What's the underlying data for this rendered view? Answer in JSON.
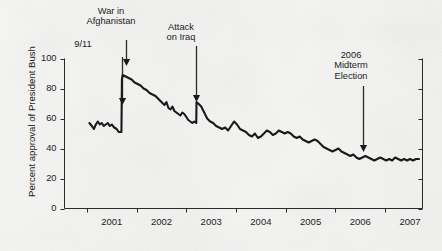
{
  "chart_data": {
    "type": "line",
    "title": "",
    "subtitle": "",
    "xlabel": "",
    "ylabel": "Percent approval of President Bush",
    "xlim": [
      2000.55,
      2007.75
    ],
    "ylim": [
      0,
      100
    ],
    "grid": false,
    "legend_position": "none",
    "series_name": "Presidential approval rating",
    "line_color": "#1a1a1a",
    "ytick_labels": [
      "0",
      "20",
      "40",
      "60",
      "80",
      "100"
    ],
    "ytick_values": [
      0,
      20,
      40,
      60,
      80,
      100
    ],
    "xtick_labels": [
      "2001",
      "2002",
      "2003",
      "2004",
      "2005",
      "2006",
      "2007"
    ],
    "xtick_values": [
      2001,
      2002,
      2003,
      2004,
      2005,
      2006,
      2007
    ],
    "x": [
      2001.05,
      2001.1,
      2001.14,
      2001.18,
      2001.22,
      2001.26,
      2001.3,
      2001.34,
      2001.38,
      2001.42,
      2001.46,
      2001.5,
      2001.55,
      2001.6,
      2001.64,
      2001.68,
      2001.695,
      2001.705,
      2001.72,
      2001.78,
      2001.84,
      2001.9,
      2001.96,
      2002.02,
      2002.08,
      2002.14,
      2002.2,
      2002.26,
      2002.32,
      2002.38,
      2002.44,
      2002.5,
      2002.56,
      2002.6,
      2002.64,
      2002.68,
      2002.72,
      2002.76,
      2002.8,
      2002.84,
      2002.88,
      2002.92,
      2002.96,
      2003.0,
      2003.04,
      2003.08,
      2003.12,
      2003.16,
      2003.2,
      2003.205,
      2003.24,
      2003.3,
      2003.36,
      2003.42,
      2003.48,
      2003.54,
      2003.6,
      2003.66,
      2003.72,
      2003.78,
      2003.84,
      2003.9,
      2003.96,
      2004.02,
      2004.08,
      2004.14,
      2004.2,
      2004.26,
      2004.32,
      2004.38,
      2004.44,
      2004.5,
      2004.56,
      2004.62,
      2004.68,
      2004.74,
      2004.8,
      2004.86,
      2004.92,
      2004.98,
      2005.04,
      2005.1,
      2005.16,
      2005.22,
      2005.28,
      2005.34,
      2005.4,
      2005.46,
      2005.52,
      2005.58,
      2005.64,
      2005.7,
      2005.76,
      2005.82,
      2005.88,
      2005.94,
      2006.0,
      2006.06,
      2006.12,
      2006.18,
      2006.24,
      2006.3,
      2006.36,
      2006.42,
      2006.48,
      2006.54,
      2006.6,
      2006.66,
      2006.72,
      2006.78,
      2006.84,
      2006.9,
      2006.96,
      2007.02,
      2007.08,
      2007.14,
      2007.2,
      2007.26,
      2007.32,
      2007.38,
      2007.44,
      2007.5,
      2007.56,
      2007.62,
      2007.68
    ],
    "y": [
      57,
      55,
      53,
      56,
      58,
      56,
      57,
      55,
      56,
      57,
      55,
      56,
      54,
      53,
      51,
      51,
      51,
      86,
      89,
      88,
      87,
      86,
      84,
      83,
      82,
      80,
      79,
      77,
      76,
      75,
      73,
      71,
      69,
      71,
      67,
      66,
      68,
      65,
      64,
      63,
      62,
      64,
      63,
      61,
      59,
      58,
      57,
      58,
      57,
      71,
      70,
      68,
      64,
      60,
      58,
      57,
      55,
      54,
      53,
      54,
      52,
      55,
      58,
      56,
      53,
      52,
      51,
      49,
      48,
      50,
      47,
      48,
      50,
      52,
      51,
      49,
      50,
      52,
      51,
      50,
      51,
      50,
      48,
      47,
      48,
      46,
      45,
      44,
      45,
      46,
      45,
      43,
      41,
      40,
      39,
      38,
      39,
      40,
      38,
      37,
      36,
      35,
      36,
      34,
      33,
      34,
      35,
      34,
      33,
      32,
      33,
      34,
      33,
      32,
      33,
      32,
      34,
      33,
      32,
      33,
      32,
      33,
      32,
      33,
      33
    ],
    "annotations": [
      {
        "id": "war-in-afghanistan",
        "label": "War in\nAfghanistan",
        "line1": "War in",
        "line2": "Afghanistan",
        "x": 2001.78,
        "y_target": 90
      },
      {
        "id": "nine-eleven",
        "label": "9/11",
        "line1": "9/11",
        "line2": "",
        "x": 2001.7,
        "y_target": 73
      },
      {
        "id": "attack-on-iraq",
        "label": "Attack\non Iraq",
        "line1": "Attack",
        "line2": "on Iraq",
        "x": 2003.2,
        "y_target": 73
      },
      {
        "id": "midterm-election",
        "label": "2006\nMidterm\nElection",
        "line1": "2006",
        "line2": "Midterm",
        "line3": "Election",
        "x": 2006.55,
        "y_target": 41
      }
    ]
  },
  "figure": {
    "axis_color": "#2a2a2a",
    "background_color": "#f4f4f3"
  }
}
